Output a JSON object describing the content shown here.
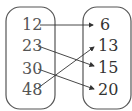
{
  "domain_set": {
    "values": [
      "12",
      "23",
      "30",
      "48"
    ]
  },
  "codomain_set": {
    "values": [
      "6",
      "13",
      "15",
      "20"
    ]
  },
  "mappings": [
    {
      "from": "12",
      "to": "6"
    },
    {
      "from": "23",
      "to": "15"
    },
    {
      "from": "30",
      "to": "20"
    },
    {
      "from": "48",
      "to": "13"
    }
  ],
  "colors": {
    "stroke": "#444444",
    "left_text": "#555555",
    "right_text": "#333333"
  }
}
